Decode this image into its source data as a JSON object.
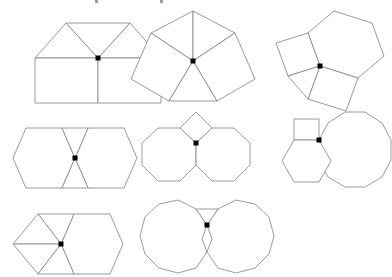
{
  "page": {
    "background_color": "#ffffff",
    "stroke_color": "#808080",
    "dot_color": "#000000",
    "width": 382,
    "height": 277
  },
  "chart_data": {
    "type": "diagram",
    "figures": [
      {
        "id": "figure-1",
        "label": "3.3.4.4",
        "position": {
          "x": 20,
          "y": 10
        },
        "marked_vertex": [
          75,
          45
        ],
        "shapes": [
          {
            "kind": "triangle",
            "sides": 3,
            "points": "12,45 75,45 43,10"
          },
          {
            "kind": "triangle",
            "sides": 3,
            "points": "75,45 138,45 107,10"
          },
          {
            "kind": "triangle",
            "sides": 3,
            "points": "43,10 107,10 75,45"
          },
          {
            "kind": "square",
            "sides": 4,
            "points": "12,45 75,45 75,90 12,90"
          },
          {
            "kind": "square",
            "sides": 4,
            "points": "75,45 138,45 138,90 75,90"
          }
        ]
      },
      {
        "id": "figure-2",
        "label": "3.3.3.4.4",
        "position": {
          "x": 128,
          "y": 8
        },
        "marked_vertex": [
          62,
          50
        ],
        "shapes": [
          {
            "kind": "triangle",
            "sides": 3,
            "points": "62,50 62,0 20,22"
          },
          {
            "kind": "triangle",
            "sides": 3,
            "points": "62,50 62,0 104,22"
          },
          {
            "kind": "square",
            "sides": 4,
            "points": "62,50 20,22 0,68 38,90"
          },
          {
            "kind": "square",
            "sides": 4,
            "points": "62,50 104,22 124,68 86,90"
          },
          {
            "kind": "triangle",
            "sides": 3,
            "points": "62,50 38,90 86,90"
          }
        ]
      },
      {
        "id": "figure-3",
        "label": "3.4.6.4",
        "position": {
          "x": 272,
          "y": 8
        },
        "marked_vertex": [
          40,
          55
        ],
        "shapes": [
          {
            "kind": "hexagon",
            "sides": 6,
            "points": "40,55 28,22 54,0 92,12 104,45 78,67"
          },
          {
            "kind": "square",
            "sides": 4,
            "points": "40,55 28,22 -4,32 8,65"
          },
          {
            "kind": "square",
            "sides": 4,
            "points": "40,55 78,67 66,100 28,88"
          },
          {
            "kind": "triangle",
            "sides": 3,
            "points": "40,55 8,65 28,88"
          }
        ]
      },
      {
        "id": "figure-4",
        "label": "3.3.6.6",
        "position": {
          "x": 10,
          "y": 122
        },
        "marked_vertex": [
          57,
          33
        ],
        "shapes": [
          {
            "kind": "hexagon",
            "sides": 6,
            "points": "57,33 44,3 8,3 -5,33 8,63 44,63"
          },
          {
            "kind": "hexagon",
            "sides": 6,
            "points": "57,33 70,3 106,3 119,33 106,63 70,63"
          },
          {
            "kind": "triangle",
            "sides": 3,
            "points": "57,33 44,3 70,3"
          },
          {
            "kind": "triangle",
            "sides": 3,
            "points": "57,33 44,63 70,63"
          }
        ]
      },
      {
        "id": "figure-5",
        "label": "4.8.8",
        "position": {
          "x": 133,
          "y": 108
        },
        "marked_vertex": [
          59,
          29
        ],
        "shapes": [
          {
            "kind": "octagon",
            "sides": 8,
            "points": "59,29 43,14 21,14 5,29 5,51 21,67 43,67 59,51"
          },
          {
            "kind": "octagon",
            "sides": 8,
            "points": "59,29 75,14 97,14 113,29 113,51 97,67 75,67 59,51"
          },
          {
            "kind": "square",
            "sides": 4,
            "points": "59,29 43,14 59,-2 75,14"
          }
        ]
      },
      {
        "id": "figure-6",
        "label": "4.6.12",
        "position": {
          "x": 278,
          "y": 103
        },
        "marked_vertex": [
          33,
          34
        ],
        "shapes": [
          {
            "kind": "dodecagon",
            "sides": 12,
            "points": "33,34 42,17 59,6 79,6 96,17 105,34 105,54 96,71 79,81 59,81 42,71 33,54"
          },
          {
            "kind": "square",
            "sides": 4,
            "points": "33,34 33,13 8,13 8,34"
          },
          {
            "kind": "hexagon",
            "sides": 6,
            "points": "33,34 8,34 -4,55 8,76 33,76 45,55"
          }
        ]
      },
      {
        "id": "figure-7",
        "label": "3.3.3.3.6",
        "position": {
          "x": 10,
          "y": 207
        },
        "marked_vertex": [
          47,
          34
        ],
        "shapes": [
          {
            "kind": "hexagon",
            "sides": 6,
            "points": "47,34 60,4 96,4 109,34 96,64 60,64"
          },
          {
            "kind": "triangle",
            "sides": 3,
            "points": "47,34 60,4 24,4"
          },
          {
            "kind": "triangle",
            "sides": 3,
            "points": "47,34 24,4 -1,34"
          },
          {
            "kind": "triangle",
            "sides": 3,
            "points": "47,34 -1,34 24,64"
          },
          {
            "kind": "triangle",
            "sides": 3,
            "points": "47,34 24,64 60,64"
          }
        ]
      },
      {
        "id": "figure-8",
        "label": "3.12.12",
        "position": {
          "x": 133,
          "y": 193
        },
        "marked_vertex": [
          69,
          29
        ]
      }
    ]
  },
  "marks": {
    "items": [
      {
        "x": 95,
        "y": 0
      },
      {
        "x": 160,
        "y": 0
      }
    ]
  }
}
